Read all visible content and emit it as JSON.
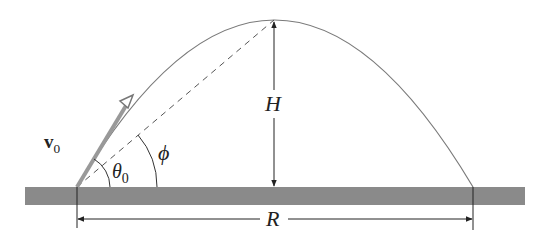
{
  "diagram": {
    "type": "projectile-motion",
    "labels": {
      "velocity": "v",
      "velocity_sub": "0",
      "theta": "θ",
      "theta_sub": "0",
      "phi": "ϕ",
      "height": "H",
      "range": "R"
    },
    "colors": {
      "ground": "#8a8a8a",
      "trajectory": "#7a7a7a",
      "lines": "#333333",
      "arrow": "#999999"
    }
  }
}
